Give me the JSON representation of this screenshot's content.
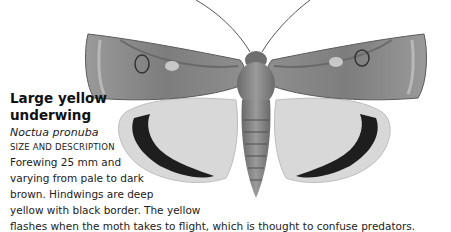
{
  "species": {
    "common_name_line1": "Large yellow",
    "common_name_line2": "underwing",
    "latin_name": "Noctua pronuba",
    "section_heading": "Size and description",
    "description_lines": [
      "Forewing 25 mm and",
      "varying from pale to dark",
      "brown. Hindwings are deep",
      "yellow with black border. The yellow",
      "flashes when the moth takes to flight, which is thought to confuse predators."
    ]
  },
  "illustration": {
    "subject": "moth-illustration",
    "colors": {
      "forewing": "#8a8a8a",
      "forewing_dark": "#5e5e5e",
      "hindwing": "#d6d6d6",
      "hindwing_band": "#1e1e1e",
      "body": "#7a7a7a"
    }
  }
}
